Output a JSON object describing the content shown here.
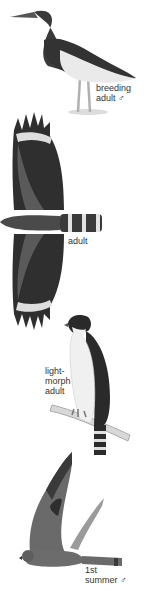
{
  "plate": {
    "figures": [
      {
        "id": "heron",
        "label": "breeding\nadult ♂"
      },
      {
        "id": "eagle-flight",
        "label": "adult"
      },
      {
        "id": "hawk-perched",
        "label": "light-\nmorph\nadult"
      },
      {
        "id": "falcon-flight",
        "label": "1st\nsummer ♂"
      }
    ]
  },
  "colors": {
    "dark": "#2a2a2a",
    "mid": "#6a6a6a",
    "light": "#e6e6e6",
    "background": "#ffffff"
  }
}
